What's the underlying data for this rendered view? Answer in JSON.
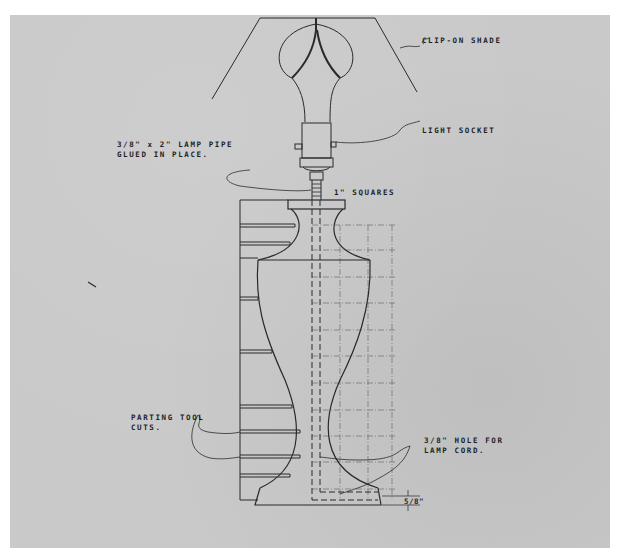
{
  "drawing": {
    "title": "Turned table lamp — side elevation",
    "paper_color": "#c9c9c9",
    "ink_color": "#2a2a2a",
    "labels": {
      "shade": "CLIP-ON SHADE",
      "socket": "LIGHT SOCKET",
      "pipe_line1": "3/8\" x 2\" LAMP PIPE",
      "pipe_line2": "GLUED IN PLACE.",
      "grid": "1\" SQUARES",
      "parting_line1": "PARTING TOOL",
      "parting_line2": "CUTS.",
      "hole_line1": "3/8\" HOLE FOR",
      "hole_line2": "LAMP CORD.",
      "dimension": "5/8\""
    },
    "parts": [
      "clip-on-shade",
      "light-bulb",
      "light-socket",
      "lamp-pipe",
      "lamp-body",
      "cord-hole",
      "base",
      "parting-tool-cuts",
      "grid-squares"
    ]
  }
}
